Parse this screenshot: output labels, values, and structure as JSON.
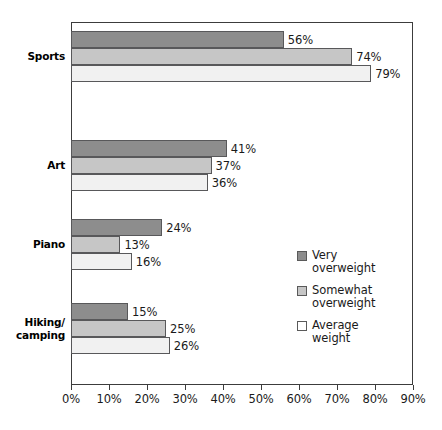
{
  "chart_data": {
    "type": "bar",
    "orientation": "horizontal",
    "title": "",
    "xlabel": "",
    "ylabel": "",
    "xlim": [
      0,
      90
    ],
    "grid": false,
    "legend_position": "inside-right",
    "categories": [
      "Sports",
      "Art",
      "Piano",
      "Hiking/\ncamping"
    ],
    "tick_labels": [
      "0%",
      "10%",
      "20%",
      "30%",
      "40%",
      "50%",
      "60%",
      "70%",
      "80%",
      "90%"
    ],
    "tick_values": [
      0,
      10,
      20,
      30,
      40,
      50,
      60,
      70,
      80,
      90
    ],
    "series": [
      {
        "name": "Very\noverweight",
        "color": "#8d8d8d",
        "values": [
          56,
          41,
          24,
          15
        ],
        "labels": [
          "56%",
          "41%",
          "24%",
          "15%"
        ]
      },
      {
        "name": "Somewhat\noverweight",
        "color": "#c6c6c6",
        "values": [
          74,
          37,
          13,
          25
        ],
        "labels": [
          "74%",
          "37%",
          "13%",
          "25%"
        ]
      },
      {
        "name": "Average\nweight",
        "color": "#f1f1f1",
        "values": [
          79,
          36,
          16,
          26
        ],
        "labels": [
          "79%",
          "36%",
          "16%",
          "26%"
        ]
      }
    ]
  }
}
